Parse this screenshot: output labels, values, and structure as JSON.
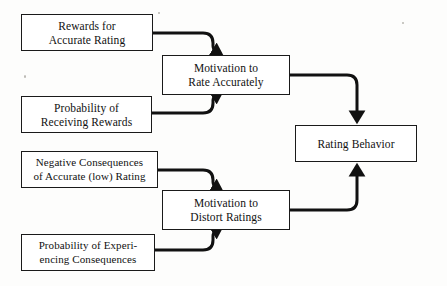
{
  "diagram": {
    "type": "flow-diagram",
    "title": "",
    "canvas": {
      "width": 447,
      "height": 286,
      "background": "#fdfdfc"
    },
    "style": {
      "node_border_color": "#1a1a1a",
      "node_fill": "#ffffff",
      "connector_color": "#111111",
      "connector_width": 3,
      "text_color": "#111111"
    },
    "nodes": [
      {
        "id": "rewards-accurate-rating",
        "label": "Rewards for\nAccurate Rating",
        "x": 21,
        "y": 14,
        "w": 132,
        "h": 37
      },
      {
        "id": "probability-receiving-rewards",
        "label": "Probability of\nReceiving Rewards",
        "x": 21,
        "y": 96,
        "w": 131,
        "h": 37
      },
      {
        "id": "negative-consequences",
        "label": "Negative Consequences\nof Accurate (low) Rating",
        "x": 21,
        "y": 151,
        "w": 137,
        "h": 37
      },
      {
        "id": "probability-experiencing-consequences",
        "label": "Probability of Experi-\nencing Consequences",
        "x": 21,
        "y": 234,
        "w": 134,
        "h": 37
      },
      {
        "id": "motivation-rate-accurately",
        "label": "Motivation to\nRate Accurately",
        "x": 162,
        "y": 55,
        "w": 128,
        "h": 40
      },
      {
        "id": "motivation-distort-ratings",
        "label": "Motivation to\nDistort Ratings",
        "x": 162,
        "y": 190,
        "w": 128,
        "h": 40
      },
      {
        "id": "rating-behavior",
        "label": "Rating Behavior",
        "x": 295,
        "y": 125,
        "w": 122,
        "h": 37
      }
    ],
    "edges": [
      {
        "id": "edge-rewards-to-motivation-accurate",
        "from": "rewards-accurate-rating",
        "to": "motivation-rate-accurately",
        "arrowhead": "down"
      },
      {
        "id": "edge-probability-rewards-to-motivation-accurate",
        "from": "probability-receiving-rewards",
        "to": "motivation-rate-accurately",
        "arrowhead": "up"
      },
      {
        "id": "edge-negative-consequences-to-motivation-distort",
        "from": "negative-consequences",
        "to": "motivation-distort-ratings",
        "arrowhead": "down"
      },
      {
        "id": "edge-probability-consequences-to-motivation-distort",
        "from": "probability-experiencing-consequences",
        "to": "motivation-distort-ratings",
        "arrowhead": "up"
      },
      {
        "id": "edge-motivation-accurate-to-rating-behavior",
        "from": "motivation-rate-accurately",
        "to": "rating-behavior",
        "arrowhead": "down"
      },
      {
        "id": "edge-motivation-distort-to-rating-behavior",
        "from": "motivation-distort-ratings",
        "to": "rating-behavior",
        "arrowhead": "up"
      }
    ]
  }
}
